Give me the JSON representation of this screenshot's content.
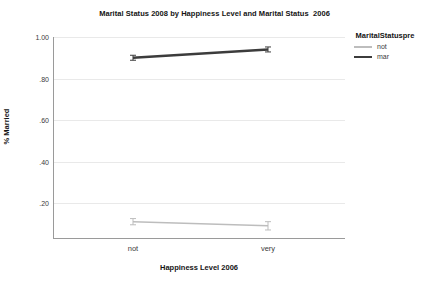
{
  "chart_data": {
    "type": "line",
    "title": "Marital Status 2008 by Happiness Level and Marital Status  2006",
    "xlabel": "Happiness Level 2006",
    "ylabel": "% Married",
    "categories": [
      "not",
      "very"
    ],
    "ylim": [
      0.0,
      1.05
    ],
    "yticks": [
      "1.00",
      ".80",
      ".60",
      ".40",
      ".20"
    ],
    "ytick_values": [
      1.0,
      0.8,
      0.6,
      0.4,
      0.2
    ],
    "grid": true,
    "legend_position": "right",
    "legend_title": "MaritalStatuspre",
    "series": [
      {
        "name": "not",
        "values": [
          0.11,
          0.09
        ],
        "color": "#bdbdbd",
        "width": 1.6,
        "error_bars": [
          0.015,
          0.02
        ]
      },
      {
        "name": "mar",
        "values": [
          0.9,
          0.94
        ],
        "color": "#3c3c3c",
        "width": 2.4,
        "error_bars": [
          0.012,
          0.012
        ]
      }
    ]
  },
  "colors": {
    "grid": "#e9e9e9",
    "axis": "#9a9a9a",
    "text": "#3b3b3b",
    "title": "#141414",
    "series_not": "#bdbdbd",
    "series_mar": "#3c3c3c"
  }
}
